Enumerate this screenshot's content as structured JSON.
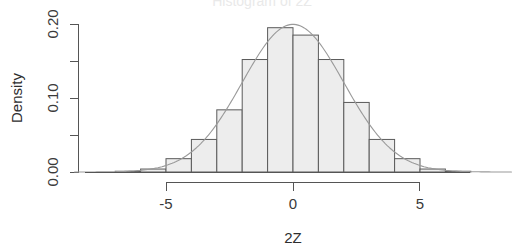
{
  "figure": {
    "title_clipped": "Histogram of 2Z",
    "background_color": "#ffffff",
    "bar_fill_color": "#ededed",
    "bar_stroke_color": "#5a5a5a",
    "curve_color": "#9a9a9a",
    "axis_color": "#555555"
  },
  "axes": {
    "x_label": "2Z",
    "y_label": "Density",
    "x_ticks": [
      "-5",
      "0",
      "5"
    ],
    "x_tick_values": [
      -5,
      0,
      5
    ],
    "y_ticks": [
      "0.00",
      "0.10",
      "0.20"
    ],
    "y_tick_values": [
      0.0,
      0.1,
      0.2
    ],
    "y_minor_tick_values": [
      0.05,
      0.15
    ],
    "xlim": [
      -5,
      5
    ],
    "ylim": [
      0.0,
      0.2
    ]
  },
  "chart_data": {
    "type": "bar",
    "title": "Histogram of 2Z",
    "xlabel": "2Z",
    "ylabel": "Density",
    "xlim": [
      -5,
      5
    ],
    "ylim": [
      0,
      0.2
    ],
    "grid": false,
    "legend": "none",
    "bin_width": 1,
    "bin_edges": [
      -7,
      -6,
      -5,
      -4,
      -3,
      -2,
      -1,
      0,
      1,
      2,
      3,
      4,
      5,
      6,
      7
    ],
    "categories": [
      "-7 to -6",
      "-6 to -5",
      "-5 to -4",
      "-4 to -3",
      "-3 to -2",
      "-2 to -1",
      "-1 to 0",
      "0 to 1",
      "1 to 2",
      "2 to 3",
      "3 to 4",
      "4 to 5",
      "5 to 6",
      "6 to 7"
    ],
    "values": [
      0.001,
      0.004,
      0.018,
      0.044,
      0.084,
      0.152,
      0.195,
      0.185,
      0.152,
      0.094,
      0.044,
      0.018,
      0.004,
      0.001
    ],
    "series": [
      {
        "name": "Density histogram",
        "values": [
          0.001,
          0.004,
          0.018,
          0.044,
          0.084,
          0.152,
          0.195,
          0.185,
          0.152,
          0.094,
          0.044,
          0.018,
          0.004,
          0.001
        ]
      },
      {
        "name": "Normal density curve",
        "type": "line",
        "mean": 0,
        "sd": 2,
        "peak": 0.2,
        "x": [
          -7,
          -6,
          -5,
          -4,
          -3,
          -2,
          -1,
          0,
          1,
          2,
          3,
          4,
          5,
          6,
          7
        ],
        "values": [
          0.0018,
          0.0066,
          0.0175,
          0.027,
          0.0648,
          0.121,
          0.176,
          0.1995,
          0.176,
          0.121,
          0.0648,
          0.027,
          0.0175,
          0.0066,
          0.0018
        ]
      }
    ]
  }
}
